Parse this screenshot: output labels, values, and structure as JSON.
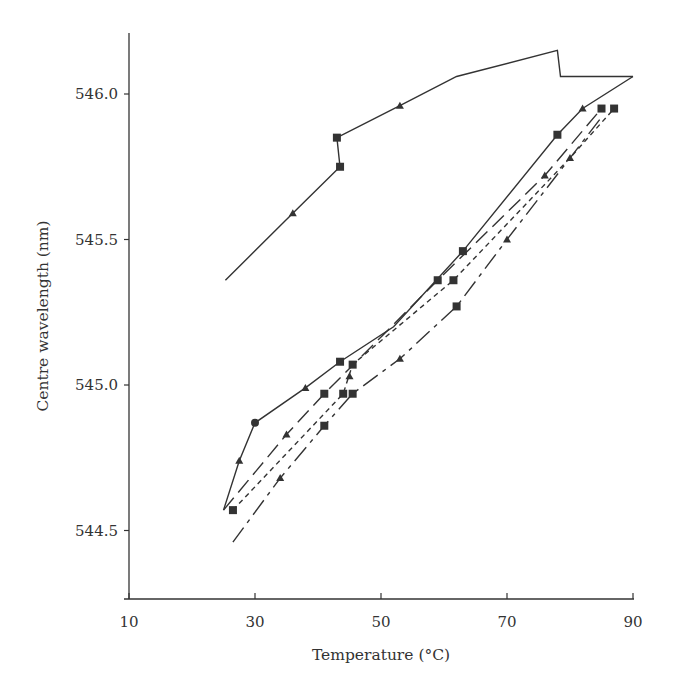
{
  "chart_data": {
    "type": "line",
    "title": "",
    "xlabel": "Temperature (°C)",
    "ylabel": "Centre wavelength (nm)",
    "xlim": [
      10,
      90
    ],
    "ylim": [
      544.22,
      546.22
    ],
    "xticks": [
      10,
      30,
      50,
      70,
      90
    ],
    "yticks": [
      544.5,
      545.0,
      545.5,
      546.0
    ],
    "ytick_labels": [
      "544.5",
      "545.0",
      "545.5",
      "546.0"
    ],
    "grid": false,
    "legend": null,
    "line_color": "#333333",
    "series": [
      {
        "name": "cycle-1-heating",
        "style": "solid",
        "points": [
          [
            25.3,
            545.36
          ],
          [
            36,
            545.59
          ],
          [
            43.5,
            545.75
          ],
          [
            43,
            545.85
          ],
          [
            53,
            545.96
          ],
          [
            62,
            546.06
          ],
          [
            78,
            546.15
          ],
          [
            78.5,
            546.06
          ],
          [
            90,
            546.06
          ]
        ],
        "markers": [
          {
            "x": 36,
            "y": 545.59,
            "shape": "arrow"
          },
          {
            "x": 43.5,
            "y": 545.75,
            "shape": "square"
          },
          {
            "x": 43,
            "y": 545.85,
            "shape": "square"
          },
          {
            "x": 53,
            "y": 545.96,
            "shape": "arrow"
          }
        ]
      },
      {
        "name": "cycle-1-cooling",
        "style": "solid",
        "points": [
          [
            90,
            546.06
          ],
          [
            82,
            545.95
          ],
          [
            78,
            545.86
          ],
          [
            63,
            545.46
          ],
          [
            52,
            545.2
          ],
          [
            43.5,
            545.08
          ],
          [
            38,
            544.99
          ],
          [
            30,
            544.87
          ],
          [
            27.5,
            544.74
          ],
          [
            25,
            544.57
          ]
        ],
        "markers": [
          {
            "x": 82,
            "y": 545.95,
            "shape": "arrow"
          },
          {
            "x": 78,
            "y": 545.86,
            "shape": "square"
          },
          {
            "x": 63,
            "y": 545.46,
            "shape": "square"
          },
          {
            "x": 43.5,
            "y": 545.08,
            "shape": "square"
          },
          {
            "x": 38,
            "y": 544.99,
            "shape": "arrow"
          },
          {
            "x": 30,
            "y": 544.87,
            "shape": "circle"
          },
          {
            "x": 27.5,
            "y": 544.74,
            "shape": "arrow"
          }
        ]
      },
      {
        "name": "cycle-2",
        "style": "long-dash",
        "points": [
          [
            25,
            544.57
          ],
          [
            35,
            544.83
          ],
          [
            41,
            544.97
          ],
          [
            59,
            545.36
          ],
          [
            76,
            545.72
          ],
          [
            85,
            545.95
          ]
        ],
        "markers": [
          {
            "x": 35,
            "y": 544.83,
            "shape": "arrow"
          },
          {
            "x": 41,
            "y": 544.97,
            "shape": "square"
          },
          {
            "x": 59,
            "y": 545.36,
            "shape": "square"
          },
          {
            "x": 76,
            "y": 545.72,
            "shape": "arrow"
          },
          {
            "x": 85,
            "y": 545.95,
            "shape": "square"
          }
        ]
      },
      {
        "name": "cycle-3",
        "style": "short-dash",
        "points": [
          [
            26.5,
            544.57
          ],
          [
            44,
            544.97
          ],
          [
            45.5,
            545.07
          ],
          [
            61.5,
            545.36
          ],
          [
            80,
            545.78
          ],
          [
            87,
            545.95
          ]
        ],
        "markers": [
          {
            "x": 26.5,
            "y": 544.57,
            "shape": "square"
          },
          {
            "x": 44,
            "y": 544.97,
            "shape": "square"
          },
          {
            "x": 45.5,
            "y": 545.07,
            "shape": "square"
          },
          {
            "x": 45,
            "y": 545.03,
            "shape": "arrow"
          },
          {
            "x": 61.5,
            "y": 545.36,
            "shape": "square"
          },
          {
            "x": 80,
            "y": 545.78,
            "shape": "arrow"
          },
          {
            "x": 87,
            "y": 545.95,
            "shape": "square"
          }
        ]
      },
      {
        "name": "cycle-4",
        "style": "dash-dot",
        "points": [
          [
            26.5,
            544.46
          ],
          [
            34,
            544.68
          ],
          [
            41,
            544.86
          ],
          [
            45.5,
            544.97
          ],
          [
            53,
            545.09
          ],
          [
            62,
            545.27
          ],
          [
            70,
            545.5
          ],
          [
            85,
            545.92
          ]
        ],
        "markers": [
          {
            "x": 34,
            "y": 544.68,
            "shape": "arrow"
          },
          {
            "x": 41,
            "y": 544.86,
            "shape": "square"
          },
          {
            "x": 45.5,
            "y": 544.97,
            "shape": "square"
          },
          {
            "x": 53,
            "y": 545.09,
            "shape": "arrow"
          },
          {
            "x": 62,
            "y": 545.27,
            "shape": "square"
          },
          {
            "x": 70,
            "y": 545.5,
            "shape": "arrow"
          }
        ]
      }
    ]
  }
}
